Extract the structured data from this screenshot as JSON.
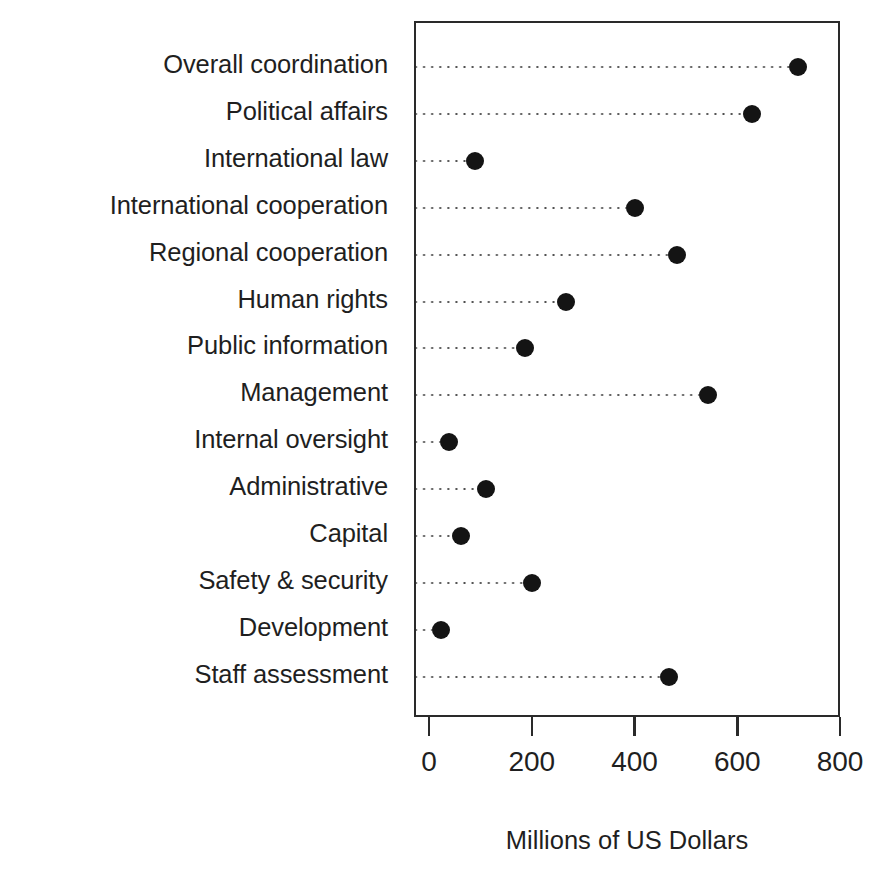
{
  "chart_data": {
    "type": "scatter",
    "subtype": "dot-plot",
    "title": "",
    "xlabel": "Millions of US Dollars",
    "ylabel": "",
    "xlim": [
      0,
      800
    ],
    "xticks": [
      0,
      200,
      400,
      600,
      800
    ],
    "xtick_labels": [
      "0",
      "200",
      "400",
      "600",
      "800"
    ],
    "grid": false,
    "legend": null,
    "leader_lines": true,
    "marker": {
      "shape": "circle",
      "color": "#141414",
      "size_px": 18
    },
    "categories": [
      "Overall coordination",
      "Political affairs",
      "International law",
      "International cooperation",
      "Regional cooperation",
      "Human rights",
      "Public information",
      "Management",
      "Internal oversight",
      "Administrative",
      "Capital",
      "Safety & security",
      "Development",
      "Staff assessment"
    ],
    "values": [
      715,
      625,
      85,
      398,
      478,
      262,
      183,
      540,
      35,
      107,
      58,
      197,
      20,
      463
    ],
    "points": [
      {
        "category": "Overall coordination",
        "value": 715
      },
      {
        "category": "Political affairs",
        "value": 625
      },
      {
        "category": "International law",
        "value": 85
      },
      {
        "category": "International cooperation",
        "value": 398
      },
      {
        "category": "Regional cooperation",
        "value": 478
      },
      {
        "category": "Human rights",
        "value": 262
      },
      {
        "category": "Public information",
        "value": 183
      },
      {
        "category": "Management",
        "value": 540
      },
      {
        "category": "Internal oversight",
        "value": 35
      },
      {
        "category": "Administrative",
        "value": 107
      },
      {
        "category": "Capital",
        "value": 58
      },
      {
        "category": "Safety & security",
        "value": 197
      },
      {
        "category": "Development",
        "value": 20
      },
      {
        "category": "Staff assessment",
        "value": 463
      }
    ]
  },
  "colors": {
    "marker": "#141414",
    "frame": "#2a2a2a",
    "leader": "#4d4d4d",
    "text": "#1f1f1f",
    "background": "#ffffff"
  }
}
